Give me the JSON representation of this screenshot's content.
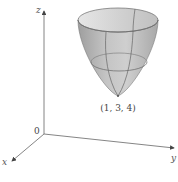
{
  "figure": {
    "type": "3d-surface-diagram",
    "surface": "elliptic paraboloid opening upward",
    "axes": {
      "z_label": "z",
      "y_label": "y",
      "x_label": "x",
      "origin_label": "0"
    },
    "vertex_label": "(1, 3, 4)",
    "colors": {
      "surface_fill": "#b9b9b9",
      "surface_inner": "#d8d8d8",
      "grid_lines": "#6a6a6a",
      "axis": "#555555"
    }
  }
}
